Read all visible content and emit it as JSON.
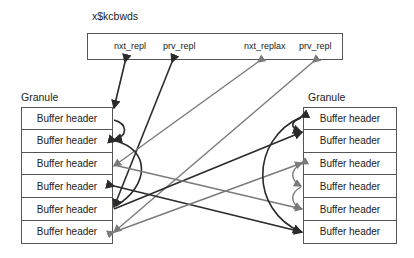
{
  "title": "x$kcbwds",
  "top_box": {
    "fields": [
      {
        "label": "nxt_repl",
        "x": 114
      },
      {
        "label": "prv_repl",
        "x": 162
      },
      {
        "label": "nxt_replax",
        "x": 243
      },
      {
        "label": "prv_repl",
        "x": 298
      }
    ]
  },
  "left_granule": {
    "label": "Granule",
    "rows": [
      "Buffer header",
      "Buffer header",
      "Buffer header",
      "Buffer header",
      "Buffer header",
      "Buffer header"
    ]
  },
  "right_granule": {
    "label": "Granule",
    "rows": [
      "Buffer header",
      "Buffer header",
      "Buffer header",
      "Buffer header",
      "Buffer header",
      "Buffer header"
    ]
  },
  "colors": {
    "dark_arrow": "#2a2a2a",
    "gray_arrow": "#7a7a7a",
    "border": "#555555"
  }
}
